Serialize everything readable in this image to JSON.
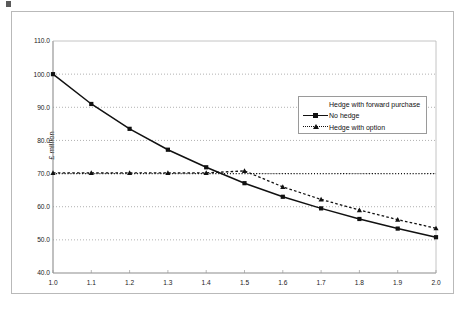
{
  "figure": {
    "y_axis_title": "£ million",
    "frame_color": "#b9b9b9",
    "gridline_color": "#9d9d9d",
    "series_color": "#111111"
  },
  "legend": {
    "position": "inside-top-right",
    "entries": [
      {
        "label": "Hedge with forward purchase",
        "marker": "none",
        "line": "none"
      },
      {
        "label": "No hedge",
        "marker": "square",
        "line": "solid"
      },
      {
        "label": "Hedge with option",
        "marker": "triangle",
        "line": "dashed"
      }
    ]
  },
  "chart_data": {
    "type": "line",
    "title": "",
    "xlabel": "",
    "ylabel": "£ million",
    "xlim": [
      1.0,
      2.0
    ],
    "ylim": [
      40.0,
      110.0
    ],
    "xticks": [
      "1.0",
      "1.1",
      "1.2",
      "1.3",
      "1.4",
      "1.5",
      "1.6",
      "1.7",
      "1.8",
      "1.9",
      "2.0"
    ],
    "yticks": [
      "40.0",
      "50.0",
      "60.0",
      "70.0",
      "80.0",
      "90.0",
      "100.0",
      "110.0"
    ],
    "grid": "horizontal-dotted",
    "x": [
      1.0,
      1.1,
      1.2,
      1.3,
      1.4,
      1.5,
      1.6,
      1.7,
      1.8,
      1.9,
      2.0
    ],
    "series": [
      {
        "name": "Hedge with forward purchase",
        "style": "dotted",
        "marker": "none",
        "values": [
          70.0,
          70.0,
          70.0,
          70.0,
          70.0,
          70.0,
          70.0,
          70.0,
          70.0,
          70.0,
          70.0
        ]
      },
      {
        "name": "No hedge",
        "style": "solid",
        "marker": "square",
        "values": [
          100.0,
          91.0,
          83.5,
          77.2,
          71.9,
          67.1,
          63.0,
          59.5,
          56.3,
          53.4,
          50.8
        ]
      },
      {
        "name": "Hedge with option",
        "style": "dashed",
        "marker": "triangle",
        "values": [
          70.2,
          70.2,
          70.2,
          70.2,
          70.2,
          70.8,
          66.0,
          62.2,
          59.0,
          56.1,
          53.5
        ]
      }
    ]
  }
}
